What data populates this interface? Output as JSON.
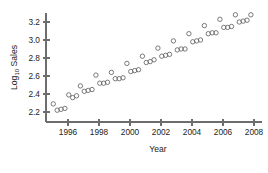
{
  "chart_data": {
    "type": "scatter",
    "title": "",
    "xlabel": "Year",
    "ylabel": "Log10 Sales",
    "ylabel_base": "Log",
    "ylabel_sub": "10",
    "ylabel_rest": " Sales",
    "xlim": [
      1995.0,
      2008.1
    ],
    "ylim": [
      2.16,
      3.32
    ],
    "grid": false,
    "legend": null,
    "marker": "open-circle",
    "marker_color": "#636363",
    "axis_color": "#6d6d6d",
    "xticks": [
      1996,
      1998,
      2000,
      2002,
      2004,
      2006,
      2008
    ],
    "xticklabels": [
      "1996",
      "1998",
      "2000",
      "2002",
      "2004",
      "2006",
      "2008"
    ],
    "yticks": [
      2.2,
      2.4,
      2.6,
      2.8,
      3.0,
      3.2
    ],
    "yticklabels": [
      "2.2",
      "2.4",
      "2.6",
      "2.8",
      "3.0",
      "3.2"
    ],
    "x": [
      1995.05,
      1995.3,
      1995.55,
      1995.8,
      1996.05,
      1996.3,
      1996.55,
      1996.8,
      1997.05,
      1997.3,
      1997.55,
      1997.8,
      1998.05,
      1998.3,
      1998.55,
      1998.8,
      1999.05,
      1999.3,
      1999.55,
      1999.8,
      2000.05,
      2000.3,
      2000.55,
      2000.8,
      2001.05,
      2001.3,
      2001.55,
      2001.8,
      2002.05,
      2002.3,
      2002.55,
      2002.8,
      2003.05,
      2003.3,
      2003.55,
      2003.8,
      2004.05,
      2004.3,
      2004.55,
      2004.8,
      2005.05,
      2005.3,
      2005.55,
      2005.8,
      2006.05,
      2006.3,
      2006.55,
      2006.8,
      2007.05,
      2007.3,
      2007.55,
      2007.8
    ],
    "y": [
      2.29,
      2.22,
      2.23,
      2.24,
      2.39,
      2.36,
      2.38,
      2.49,
      2.43,
      2.44,
      2.45,
      2.61,
      2.52,
      2.52,
      2.53,
      2.64,
      2.57,
      2.57,
      2.58,
      2.74,
      2.65,
      2.66,
      2.67,
      2.82,
      2.75,
      2.76,
      2.78,
      2.91,
      2.82,
      2.83,
      2.84,
      2.99,
      2.89,
      2.9,
      2.9,
      3.07,
      2.98,
      2.99,
      3.0,
      3.16,
      3.07,
      3.08,
      3.08,
      3.23,
      3.14,
      3.14,
      3.15,
      3.28,
      3.2,
      3.21,
      3.22,
      3.28
    ]
  }
}
